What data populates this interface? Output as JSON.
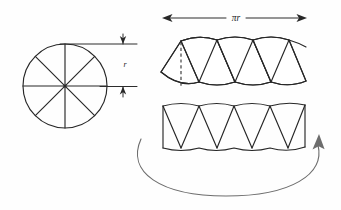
{
  "figure": {
    "background_color": "#fefefe",
    "line_color": "#272727",
    "sweep_arrow_color": "#6d6d6d",
    "labels": {
      "radius": "r",
      "half_circumference": "πr"
    }
  },
  "circle": {
    "name": "divided-circle",
    "center_x": 65,
    "center_y": 86,
    "radius": 42,
    "sector_count": 8,
    "spoke_angles_deg": [
      0,
      45,
      90,
      135,
      180,
      225,
      270,
      315
    ]
  },
  "radius_dimension": {
    "name": "radius-dimension",
    "label": "r",
    "label_x": 124,
    "label_y": 65,
    "top_y": 44,
    "bottom_y": 87,
    "line_x": 123,
    "extension_left_x": 58,
    "extension_right_x": 137
  },
  "width_dimension": {
    "name": "half-circumference-dimension",
    "label": "πr",
    "label_x": 236,
    "label_y": 18,
    "left_x": 163,
    "right_x": 306,
    "line_y": 18
  },
  "upper_strip": {
    "name": "upper-sector-strip",
    "left_x": 160,
    "right_x": 306,
    "top_y": 35,
    "bottom_y": 89,
    "sector_count": 8,
    "dashed_height_line": {
      "x": 181,
      "top_y": 42,
      "bottom_y": 86
    }
  },
  "lower_strip": {
    "name": "lower-sector-strip",
    "left_x": 162,
    "right_x": 305,
    "top_y": 103,
    "bottom_y": 149,
    "sector_count": 8,
    "flat_ends": true
  },
  "sweep_arrow": {
    "name": "rotation-sweep-arrow",
    "start_x": 141,
    "start_y": 139,
    "end_x": 319,
    "end_y": 139,
    "bottom_y": 196,
    "direction": "counterclockwise-to-right"
  }
}
